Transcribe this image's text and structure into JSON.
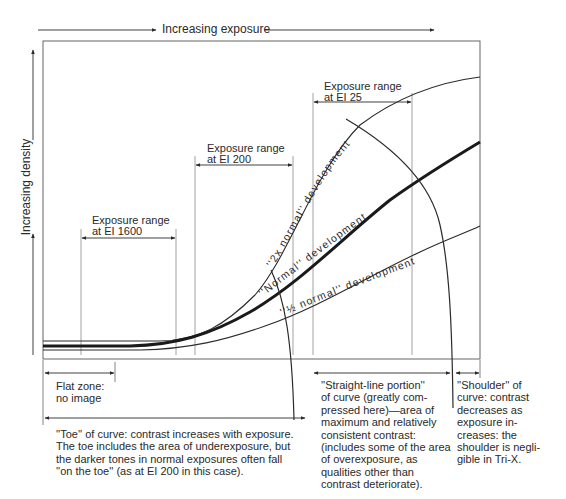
{
  "diagram": {
    "type": "characteristic-curve",
    "axes": {
      "x_label": "Increasing exposure",
      "y_label": "Increasing density"
    },
    "curves": [
      {
        "id": "two_x",
        "label": "''2x normal'' development",
        "weight": "thin"
      },
      {
        "id": "normal",
        "label": "''Normal'' development",
        "weight": "bold"
      },
      {
        "id": "half",
        "label": "''½ normal'' development",
        "weight": "thin"
      }
    ],
    "exposure_ranges": [
      {
        "id": "ei1600",
        "line1": "Exposure range",
        "line2": "at EI 1600"
      },
      {
        "id": "ei200",
        "line1": "Exposure range",
        "line2": "at EI 200"
      },
      {
        "id": "ei25",
        "line1": "Exposure range",
        "line2": "at EI 25"
      }
    ],
    "zones": {
      "flat": {
        "text": "Flat zone:\nno image"
      },
      "toe": {
        "text": "''Toe'' of curve: contrast increases with exposure.\nThe toe includes the area of underexposure, but\nthe darker tones in normal exposures often fall\n''on the toe'' (as at EI 200 in this case)."
      },
      "straight": {
        "text": "''Straight-line portion''\nof curve (greatly com-\npressed here)—area of\nmaximum and relatively\nconsistent contrast:\n(includes some of the area\nof overexposure, as\nqualities other than\ncontrast deteriorate)."
      },
      "shoulder": {
        "text": "''Shoulder'' of\ncurve: contrast\ndecreases as\nexposure in-\ncreases: the\nshoulder is negli-\ngible in Tri-X."
      }
    },
    "colors": {
      "ink": "#2a2a2a",
      "grid_line": "#8a8a8a",
      "background": "#ffffff"
    }
  }
}
